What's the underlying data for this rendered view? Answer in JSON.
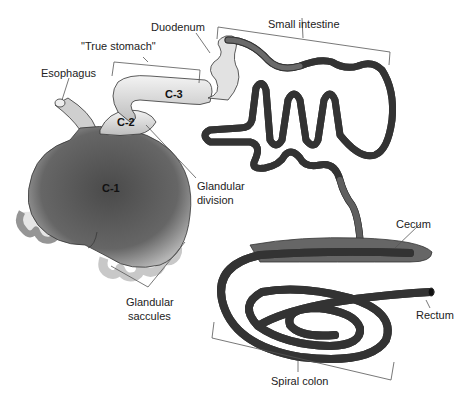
{
  "figure": {
    "labels": {
      "duodenum": "Duodenum",
      "small_intestine": "Small intestine",
      "true_stomach": "\"True stomach\"",
      "esophagus": "Esophagus",
      "glandular_division_1": "Glandular",
      "glandular_division_2": "division",
      "cecum": "Cecum",
      "rectum": "Rectum",
      "glandular_saccules_1": "Glandular",
      "glandular_saccules_2": "saccules",
      "spiral_colon": "Spiral colon"
    },
    "compartments": {
      "c1": "C-1",
      "c2": "C-2",
      "c3": "C-3"
    },
    "colors": {
      "stomach_dark": "#5a5a5a",
      "tube_light": "#e6e6e6",
      "tube_dark": "#6e6e6e",
      "outline": "#333333",
      "leader": "#555555"
    }
  }
}
